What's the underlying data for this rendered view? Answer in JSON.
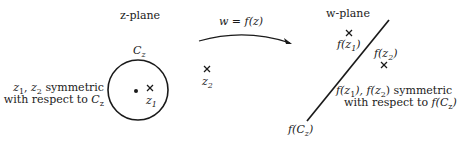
{
  "diagram": {
    "z_plane": {
      "title": "z-plane",
      "circle_label": "C",
      "circle_label_sub": "z",
      "center_dot": "point",
      "point_z1": {
        "marker": "x",
        "label": "z",
        "sub": "1"
      },
      "point_z2": {
        "marker": "x",
        "label": "z",
        "sub": "2"
      },
      "note_line1": {
        "a": "z",
        "a_sub": "1",
        "sep": ", ",
        "b": "z",
        "b_sub": "2",
        "rest": " symmetric"
      },
      "note_line2": {
        "text": "with respect to ",
        "c": "C",
        "c_sub": "z"
      }
    },
    "mapping": {
      "label": "w = f(z)"
    },
    "w_plane": {
      "title": "w-plane",
      "line_label": {
        "f": "f(",
        "c": "C",
        "c_sub": "z",
        "close": ")"
      },
      "point_fz1": {
        "marker": "x",
        "pre": "f(z",
        "sub": "1",
        "post": ")"
      },
      "point_fz2": {
        "marker": "x",
        "pre": "f(z",
        "sub": "2",
        "post": ")"
      },
      "note_line1": {
        "p1": "f(z",
        "s1": "1",
        "p2": "), f(z",
        "s2": "2",
        "p3": ") symmetric"
      },
      "note_line2": {
        "text": "with respect to ",
        "f": "f(C",
        "sub": "z",
        "close": ")"
      }
    }
  }
}
